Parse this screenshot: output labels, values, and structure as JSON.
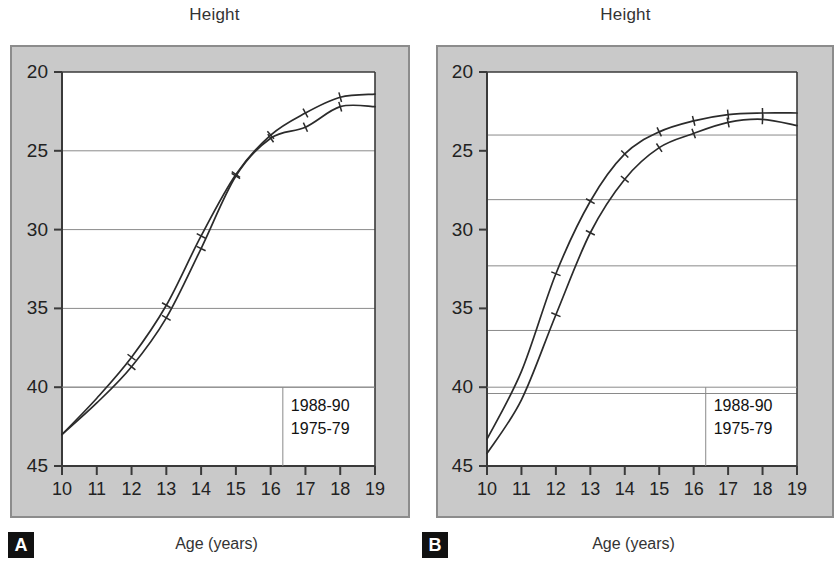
{
  "figure": {
    "panels": [
      {
        "id": "A",
        "badge": "A",
        "title": "Height",
        "xlabel": "Age (years)",
        "legend": [
          "1988-90",
          "1975-79"
        ],
        "yticks": [
          "45",
          "40",
          "35",
          "30",
          "25",
          "20"
        ],
        "xticks": [
          "10",
          "11",
          "12",
          "13",
          "14",
          "15",
          "16",
          "17",
          "18",
          "19"
        ]
      },
      {
        "id": "B",
        "badge": "B",
        "title": "Height",
        "xlabel": "Age (years)",
        "legend": [
          "1988-90",
          "1975-79"
        ],
        "yticks": [
          "45",
          "40",
          "35",
          "30",
          "25",
          "20"
        ],
        "xticks": [
          "10",
          "11",
          "12",
          "13",
          "14",
          "15",
          "16",
          "17",
          "18",
          "19"
        ]
      }
    ]
  },
  "chart_data": [
    {
      "type": "line",
      "panel": "A",
      "title": "Height",
      "xlabel": "Age (years)",
      "ylabel": "Height",
      "xlim": [
        10,
        19
      ],
      "ylim": [
        20,
        45
      ],
      "xticks": [
        10,
        11,
        12,
        13,
        14,
        15,
        16,
        17,
        18,
        19
      ],
      "yticks": [
        20,
        25,
        30,
        35,
        40,
        45
      ],
      "grid": "horizontal",
      "gridlines": [
        25,
        30,
        35,
        40
      ],
      "legend_position": "bottom-right",
      "x": [
        10,
        11,
        12,
        13,
        14,
        15,
        16,
        17,
        18,
        19
      ],
      "series": [
        {
          "name": "1988-90",
          "values": [
            22.0,
            24.3,
            26.9,
            30.2,
            34.6,
            38.5,
            41.0,
            42.4,
            43.4,
            43.6
          ]
        },
        {
          "name": "1975-79",
          "values": [
            22.0,
            24.0,
            26.3,
            29.4,
            33.8,
            38.4,
            40.8,
            41.5,
            42.8,
            42.8
          ]
        }
      ]
    },
    {
      "type": "line",
      "panel": "B",
      "title": "Height",
      "xlabel": "Age (years)",
      "ylabel": "Height",
      "xlim": [
        10,
        19
      ],
      "ylim": [
        20,
        45
      ],
      "xticks": [
        10,
        11,
        12,
        13,
        14,
        15,
        16,
        17,
        18,
        19
      ],
      "yticks": [
        20,
        25,
        30,
        35,
        40,
        45
      ],
      "grid": "horizontal",
      "gridlines": [
        24.6,
        28.6,
        32.7,
        36.9,
        41.0
      ],
      "legend_position": "bottom-right",
      "x": [
        10,
        11,
        12,
        13,
        14,
        15,
        16,
        17,
        18,
        19
      ],
      "series": [
        {
          "name": "1988-90",
          "values": [
            21.7,
            26.0,
            32.2,
            36.8,
            39.8,
            41.2,
            41.9,
            42.3,
            42.4,
            42.4
          ]
        },
        {
          "name": "1975-79",
          "values": [
            20.8,
            24.2,
            29.6,
            34.8,
            38.2,
            40.2,
            41.1,
            41.8,
            42.0,
            41.6
          ]
        }
      ]
    }
  ]
}
